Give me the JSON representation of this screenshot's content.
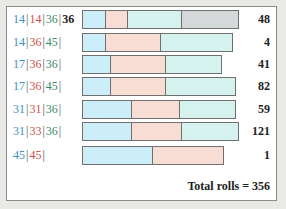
{
  "chart_data": {
    "type": "bar",
    "orientation": "horizontal-stacked",
    "title": "",
    "rows": [
      {
        "labels": [
          {
            "text": "14",
            "color": "#3f8fc0"
          },
          {
            "text": "14",
            "color": "#d0504a"
          },
          {
            "text": "36",
            "color": "#3a8a6a"
          },
          {
            "text": "36",
            "color": "#222222"
          }
        ],
        "segments": [
          23,
          22,
          55,
          56
        ],
        "segment_colors": [
          "#cceef8",
          "#f8ddd5",
          "#d6f2ee",
          "#d4d8d8"
        ],
        "count": 48
      },
      {
        "labels": [
          {
            "text": "14",
            "color": "#3f8fc0"
          },
          {
            "text": "36",
            "color": "#d0504a"
          },
          {
            "text": "45",
            "color": "#3a8a6a"
          }
        ],
        "segments": [
          23,
          56,
          71
        ],
        "segment_colors": [
          "#cceef8",
          "#f8ddd5",
          "#d6f2ee"
        ],
        "count": 4
      },
      {
        "labels": [
          {
            "text": "17",
            "color": "#3f8fc0"
          },
          {
            "text": "36",
            "color": "#d0504a"
          },
          {
            "text": "36",
            "color": "#3a8a6a"
          }
        ],
        "segments": [
          28,
          56,
          55
        ],
        "segment_colors": [
          "#cceef8",
          "#f8ddd5",
          "#d6f2ee"
        ],
        "count": 41
      },
      {
        "labels": [
          {
            "text": "17",
            "color": "#3f8fc0"
          },
          {
            "text": "36",
            "color": "#d0504a"
          },
          {
            "text": "45",
            "color": "#3a8a6a"
          }
        ],
        "segments": [
          28,
          56,
          69
        ],
        "segment_colors": [
          "#cceef8",
          "#f8ddd5",
          "#d6f2ee"
        ],
        "count": 82
      },
      {
        "labels": [
          {
            "text": "31",
            "color": "#3f8fc0"
          },
          {
            "text": "31",
            "color": "#d0504a"
          },
          {
            "text": "36",
            "color": "#3a8a6a"
          }
        ],
        "segments": [
          49,
          49,
          55
        ],
        "segment_colors": [
          "#cceef8",
          "#f8ddd5",
          "#d6f2ee"
        ],
        "count": 59
      },
      {
        "labels": [
          {
            "text": "31",
            "color": "#3f8fc0"
          },
          {
            "text": "33",
            "color": "#d0504a"
          },
          {
            "text": "36",
            "color": "#3a8a6a"
          }
        ],
        "segments": [
          49,
          51,
          56
        ],
        "segment_colors": [
          "#cceef8",
          "#f8ddd5",
          "#d6f2ee"
        ],
        "count": 121
      },
      {
        "labels": [
          {
            "text": "45",
            "color": "#3f8fc0"
          },
          {
            "text": "45",
            "color": "#d0504a"
          }
        ],
        "segments": [
          70,
          71
        ],
        "segment_colors": [
          "#cceef8",
          "#f8ddd5"
        ],
        "count": 1
      }
    ],
    "counts": [
      48,
      4,
      41,
      82,
      59,
      121,
      1
    ],
    "total_label": "Total rolls = 356",
    "total": 356
  }
}
